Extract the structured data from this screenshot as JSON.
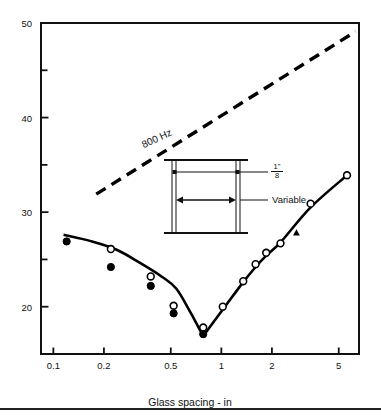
{
  "figure": {
    "background": "#ffffff",
    "axis_color": "#111111",
    "curve_color": "#000000",
    "dash_color": "#000000"
  },
  "chart_data": {
    "type": "line",
    "title": "",
    "xlabel": "Glass spacing - in",
    "ylabel": "Transmission loss - dB",
    "xscale": "log",
    "xlim": [
      0.085,
      6.6
    ],
    "ylim": [
      15,
      50
    ],
    "grid": false,
    "legend": "none",
    "xticks": [
      0.1,
      0.2,
      0.5,
      1,
      2,
      5
    ],
    "xtick_labels": [
      "0.1",
      "0.2",
      "0.5",
      "1",
      "2",
      "5"
    ],
    "yticks": [
      20,
      25,
      30,
      35,
      40,
      45,
      50
    ],
    "ytick_labels": [
      "20",
      "",
      "30",
      "",
      "40",
      "",
      "50"
    ],
    "ytick_major": [
      20,
      30,
      40,
      50
    ],
    "ytick_minor": [
      25,
      35,
      45
    ],
    "annotations": [
      {
        "text": "800 Hz",
        "x": 0.33,
        "y": 37.6,
        "rotation": -25
      }
    ],
    "series": [
      {
        "name": "800 Hz mass law (dashed)",
        "style": "dashed",
        "x": [
          0.18,
          6.3
        ],
        "y": [
          31.9,
          49.1
        ]
      },
      {
        "name": "measured fitted curve",
        "style": "solid",
        "x": [
          0.115,
          0.17,
          0.24,
          0.33,
          0.44,
          0.54,
          0.66,
          0.76,
          0.8,
          0.9,
          1.05,
          1.35,
          1.6,
          1.85,
          2.25,
          3.4,
          5.6
        ],
        "y": [
          27.6,
          26.9,
          26.0,
          24.6,
          23.2,
          21.9,
          19.3,
          17.3,
          17.2,
          18.4,
          20.0,
          22.6,
          24.2,
          25.4,
          26.8,
          30.5,
          33.9
        ]
      },
      {
        "name": "open circles",
        "style": "marker-open-circle",
        "x": [
          0.22,
          0.38,
          0.52,
          0.78,
          1.02,
          1.35,
          1.6,
          1.85,
          2.25,
          3.4,
          5.6
        ],
        "y": [
          26.1,
          23.2,
          20.1,
          17.8,
          20.0,
          22.7,
          24.5,
          25.7,
          26.7,
          30.9,
          33.9
        ]
      },
      {
        "name": "filled circles",
        "style": "marker-filled-circle",
        "x": [
          0.12,
          0.22,
          0.38,
          0.52,
          0.78
        ],
        "y": [
          26.9,
          24.2,
          22.2,
          19.3,
          17.1
        ]
      },
      {
        "name": "filled triangle",
        "style": "marker-filled-triangle",
        "x": [
          2.8
        ],
        "y": [
          27.8
        ]
      }
    ]
  },
  "inset": {
    "name": "double-glazing-cross-section",
    "thickness_label_num": "1\"",
    "thickness_label_den": "8",
    "variable_label": "Variable"
  }
}
